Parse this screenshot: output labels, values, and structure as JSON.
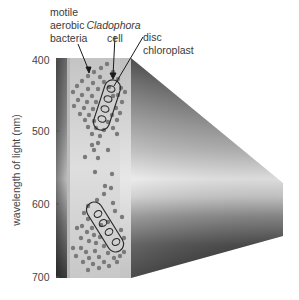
{
  "figure": {
    "labels": {
      "bacteria": [
        "motile",
        "aerobic",
        "bacteria"
      ],
      "cell": [
        "Cladophora",
        "cell"
      ],
      "chloroplast": [
        "disc",
        "chloroplast"
      ]
    },
    "axis": {
      "label": "wavelength of light (nm)",
      "ticks": [
        "400",
        "500",
        "600",
        "700"
      ]
    },
    "colors": {
      "background": "#ffffff",
      "bacteria_dot": "#7a7a7a",
      "cell_outline": "#2a2a2a",
      "strip_light": "#d9d9d9",
      "strip_dark": "#555555"
    }
  }
}
